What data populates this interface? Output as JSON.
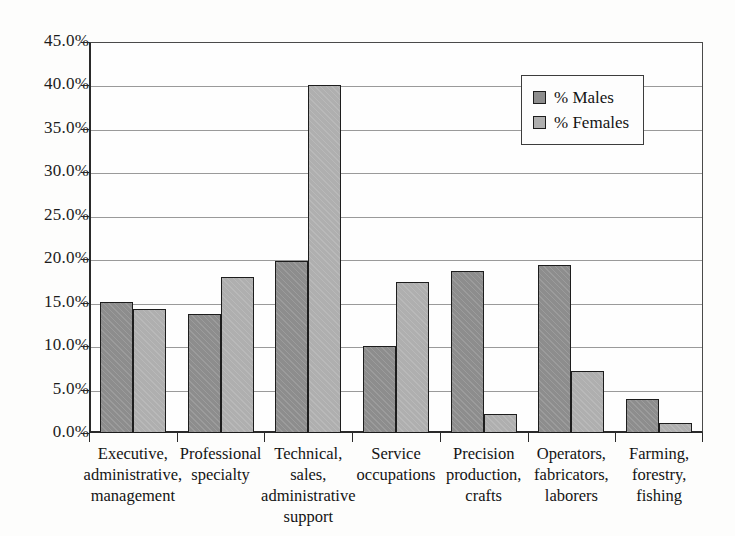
{
  "chart_data": {
    "type": "bar",
    "title": "",
    "subtitle": "",
    "xlabel": "",
    "ylabel": "",
    "ylim": [
      0,
      45
    ],
    "ytick_step": 5,
    "grid": true,
    "grid_orientation": "horizontal",
    "legend_position": "top-right",
    "value_unit": "percent",
    "categories": [
      "Executive,\nadministrative,\nmanagement",
      "Professional\nspecialty",
      "Technical,\nsales,\nadministrative\nsupport",
      "Service\noccupations",
      "Precision\nproduction,\ncrafts",
      "Operators,\nfabricators,\nlaborers",
      "Farming,\nforestry,\nfishing"
    ],
    "ytick_labels": [
      "0.0%",
      "5.0%",
      "10.0%",
      "15.0%",
      "20.0%",
      "25.0%",
      "30.0%",
      "35.0%",
      "40.0%",
      "45.0%"
    ],
    "ytick_values": [
      0,
      5,
      10,
      15,
      20,
      25,
      30,
      35,
      40,
      45
    ],
    "series": [
      {
        "name": "% Males",
        "color": "#8d8d8d",
        "values": [
          15.1,
          13.7,
          19.8,
          10.0,
          18.6,
          19.3,
          3.9
        ]
      },
      {
        "name": "% Females",
        "color": "#afafaf",
        "values": [
          14.3,
          18.0,
          40.0,
          17.4,
          2.2,
          7.1,
          1.1
        ]
      }
    ]
  },
  "legend": {
    "items": [
      {
        "label": "% Males",
        "color": "#8d8d8d"
      },
      {
        "label": "% Females",
        "color": "#afafaf"
      }
    ]
  },
  "colors": {
    "males_fill": "#8d8d8d",
    "females_fill": "#afafaf",
    "bar_outline": "#1d1d1d",
    "axis": "#2a2a2a",
    "gridline": "#9a9a9a",
    "background": "#fdfdfc",
    "text": "#141414"
  }
}
